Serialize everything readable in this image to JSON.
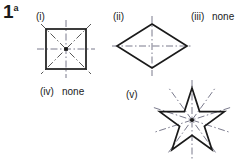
{
  "page": {
    "width": 252,
    "height": 167,
    "background": "#ffffff",
    "ink_color": "#1a1a1a",
    "axis_color": "#7a7a8c"
  },
  "question": {
    "number": "1",
    "part": "a"
  },
  "items": [
    {
      "id": "i",
      "label": "(i)",
      "shape": "square",
      "answer_text": "",
      "lines_of_symmetry": 4,
      "center": {
        "x": 66,
        "y": 49
      },
      "size": 40,
      "label_pos": {
        "x": 36,
        "y": 12
      }
    },
    {
      "id": "ii",
      "label": "(ii)",
      "shape": "rhombus",
      "answer_text": "",
      "lines_of_symmetry": 2,
      "center": {
        "x": 152,
        "y": 46
      },
      "half_width": 35,
      "half_height": 22,
      "label_pos": {
        "x": 113,
        "y": 12
      }
    },
    {
      "id": "iii",
      "label": "(iii)",
      "shape": "none",
      "answer_text": "none",
      "lines_of_symmetry": 0,
      "label_pos": {
        "x": 191,
        "y": 12
      }
    },
    {
      "id": "iv",
      "label": "(iv)",
      "shape": "none",
      "answer_text": "none",
      "lines_of_symmetry": 0,
      "label_pos": {
        "x": 40,
        "y": 87
      }
    },
    {
      "id": "v",
      "label": "(v)",
      "shape": "five-point-star",
      "answer_text": "",
      "lines_of_symmetry": 5,
      "center": {
        "x": 192,
        "y": 120
      },
      "outer_radius": 32,
      "inner_radius": 13,
      "label_pos": {
        "x": 126,
        "y": 90
      }
    }
  ]
}
